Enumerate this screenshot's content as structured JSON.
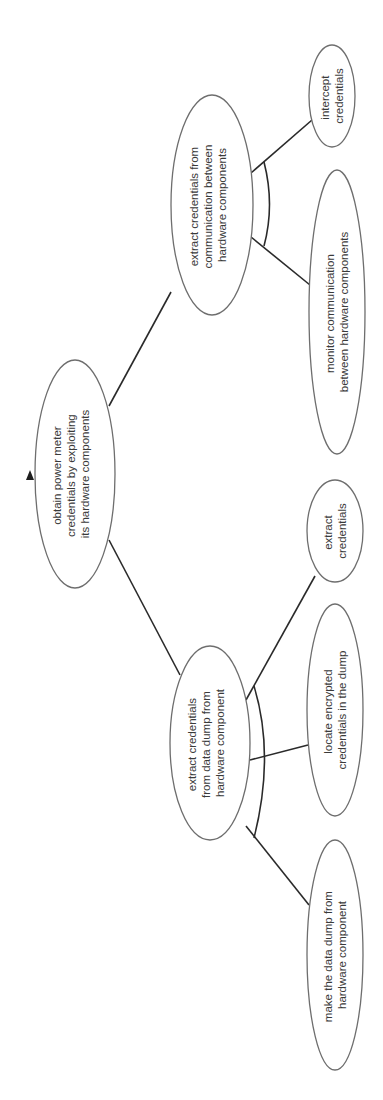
{
  "diagram": {
    "type": "attack-tree",
    "orientation": "rotated-90-ccw",
    "root": {
      "id": "root",
      "lines": [
        "obtain power meter",
        "credentials by exploiting",
        "its hardware components"
      ]
    },
    "nodes": [
      {
        "id": "comm",
        "parent": "root",
        "refinement": "AND",
        "lines": [
          "extract credentials from",
          "communication between",
          "hardware components"
        ]
      },
      {
        "id": "intercept",
        "parent": "comm",
        "lines": [
          "intercept",
          "credentials"
        ]
      },
      {
        "id": "monitor",
        "parent": "comm",
        "lines": [
          "monitor communication",
          "between hardware components"
        ]
      },
      {
        "id": "dump",
        "parent": "root",
        "refinement": "AND",
        "lines": [
          "extract credentials",
          "from data dump from",
          "hardware component"
        ]
      },
      {
        "id": "extract",
        "parent": "dump",
        "lines": [
          "extract",
          "credentials"
        ]
      },
      {
        "id": "locate",
        "parent": "dump",
        "lines": [
          "locate encrypted",
          "credentials in the dump"
        ]
      },
      {
        "id": "make",
        "parent": "dump",
        "lines": [
          "make the data dump from",
          "hardware component"
        ]
      }
    ],
    "colors": {
      "ellipse_stroke": "#6e6e6e",
      "edge": "#2a2a2a",
      "text": "#3a3a3a",
      "marker": "#1e1e1e",
      "background": "#ffffff"
    }
  }
}
